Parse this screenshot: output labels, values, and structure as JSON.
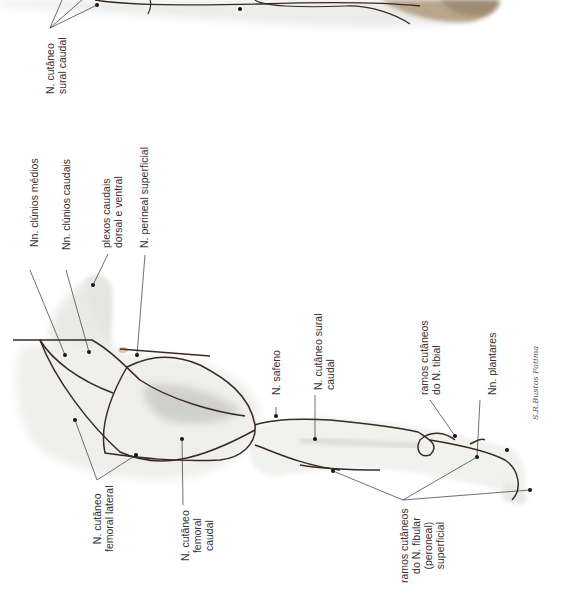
{
  "figure": {
    "colors": {
      "nerve": "#3b2a22",
      "leader_line": "#333333",
      "skin_light": "#f2f2ef",
      "skin_shadow": "#c9c9c2",
      "paw_fur": "#a89378",
      "label_text": "#333333"
    }
  },
  "labels": {
    "cutaneo_sural_caudal_top": "N. cutâneo\nsural caudal",
    "clunios_medios": "Nn. clúnios médios",
    "clunios_caudais": "Nn. clúnios caudais",
    "plexos_caudais": "plexos caudais\ndorsal e ventral",
    "perineal_superficial": "N. perineal superficial",
    "cutaneo_femoral_lateral": "N. cutâneo\nfemoral lateral",
    "cutaneo_femoral_caudal": "N. cutâneo\nfemoral\ncaudal",
    "safeno": "N. safeno",
    "cutaneo_sural_caudal": "N. cutâneo sural\ncaudal",
    "ramos_tibial": "ramos cutâneos\ndo N. tibial",
    "plantares": "Nn. plantares",
    "ramos_fibular": "ramos cutâneos\ndo N. fibular\n(peroneal)\nsuperficial"
  },
  "signature": "S.R.Bustos Fatima"
}
